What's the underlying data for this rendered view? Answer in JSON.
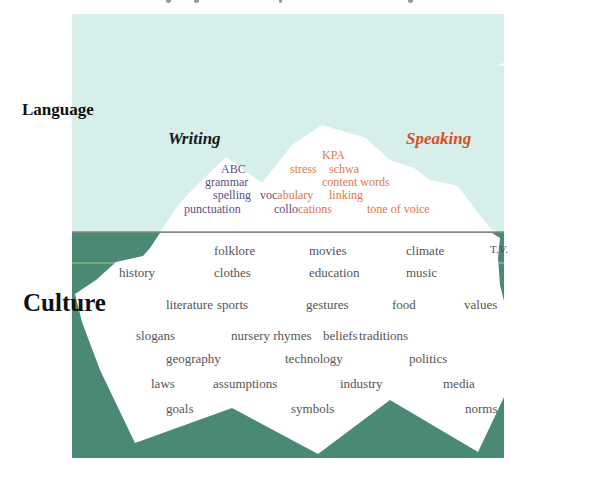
{
  "title_fragment": {
    "visible": "descenders only (title cropped at top edge)"
  },
  "colors": {
    "sky": "#d6efea",
    "water": "#4a8a72",
    "iceberg": "#ffffff",
    "waterline": "#8a8a8a",
    "writing_words": "#5a4f86",
    "speaking_words": "#e2774a",
    "speaking_heading": "#d94f1e",
    "culture_words": "#555555"
  },
  "labels": {
    "language": "Language",
    "culture": "Culture"
  },
  "headings": {
    "writing": "Writing",
    "speaking": "Speaking"
  },
  "above_water": {
    "writing": [
      "ABC",
      "grammar",
      "spelling",
      "punctuation"
    ],
    "speaking": [
      "KPA",
      "stress",
      "schwa",
      "content words",
      "linking",
      "tone of voice"
    ],
    "shared": [
      {
        "word": "vocabulary",
        "writing_part": "voc",
        "speaking_part": "abulary"
      },
      {
        "word": "collocations",
        "writing_part": "collo",
        "speaking_part": "cations"
      }
    ]
  },
  "below_water": {
    "rows": [
      [
        "folklore",
        "movies",
        "climate",
        "T.V."
      ],
      [
        "history",
        "clothes",
        "education",
        "music"
      ],
      [
        "literature",
        "sports",
        "gestures",
        "food",
        "values"
      ],
      [
        "slogans",
        "nursery rhymes",
        "beliefs",
        "traditions"
      ],
      [
        "geography",
        "technology",
        "politics"
      ],
      [
        "laws",
        "assumptions",
        "industry",
        "media"
      ],
      [
        "goals",
        "symbols",
        "norms"
      ]
    ]
  },
  "decorations": {
    "birds": 2
  }
}
